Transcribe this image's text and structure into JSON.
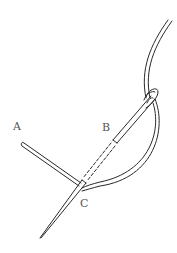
{
  "diagram": {
    "labels": {
      "a": "A",
      "b": "B",
      "c": "C"
    },
    "colors": {
      "line": "#2a2a2a",
      "label": "#555555",
      "background": "#ffffff"
    }
  }
}
